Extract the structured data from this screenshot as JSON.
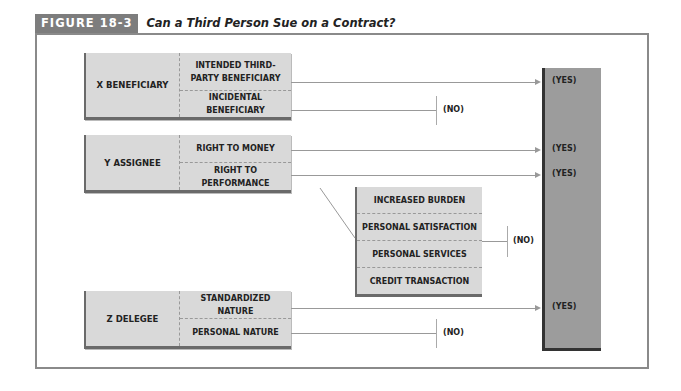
{
  "figure": {
    "tag": "FIGURE 18-3",
    "title": "Can a Third Person Sue on a Contract?"
  },
  "parties": [
    {
      "label": "X  BENEFICIARY",
      "rows": [
        {
          "label": "INTENDED THIRD-PARTY BENEFICIARY",
          "outcome": "(YES)"
        },
        {
          "label": "INCIDENTAL BENEFICIARY",
          "outcome": "(NO)"
        }
      ]
    },
    {
      "label": "Y  ASSIGNEE",
      "rows": [
        {
          "label": "RIGHT TO MONEY",
          "outcome": "(YES)"
        },
        {
          "label": "RIGHT TO PERFORMANCE",
          "outcome": "(YES)"
        }
      ]
    },
    {
      "label": "Z  DELEGEE",
      "rows": [
        {
          "label": "STANDARDIZED NATURE",
          "outcome": "(YES)"
        },
        {
          "label": "PERSONAL NATURE",
          "outcome": "(NO)"
        }
      ]
    }
  ],
  "exceptions": {
    "items": [
      "INCREASED BURDEN",
      "PERSONAL SATISFACTION",
      "PERSONAL SERVICES",
      "CREDIT TRANSACTION"
    ],
    "outcome": "(NO)"
  },
  "colors": {
    "tag_bg": "#7d7d7d",
    "box_fill": "#d9d9d9",
    "yes_bar": "#9c9c9c",
    "frame": "#8a8a8a"
  }
}
